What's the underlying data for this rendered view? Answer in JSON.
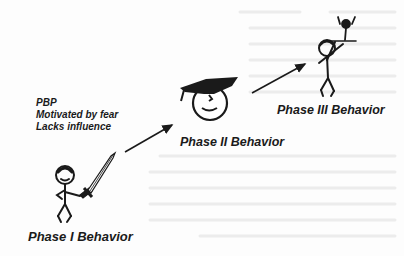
{
  "diagram": {
    "type": "stage progression",
    "phases": [
      {
        "label": "Phase I Behavior",
        "figure": "stick figure holding sword",
        "notes": [
          "PBP",
          "Motivated by fear",
          "Lacks influence"
        ]
      },
      {
        "label": "Phase II Behavior",
        "figure": "smiling face with graduation cap"
      },
      {
        "label": "Phase III Behavior",
        "figure": "stick figure lifting a small figure overhead"
      }
    ],
    "arrows": [
      {
        "from": "Phase I Behavior",
        "to": "Phase II Behavior"
      },
      {
        "from": "Phase II Behavior",
        "to": "Phase III Behavior"
      }
    ]
  },
  "colors": {
    "ink": "#1a1a1a",
    "background": "#fdfdfd",
    "bleed_text": "#e6e6e6"
  }
}
